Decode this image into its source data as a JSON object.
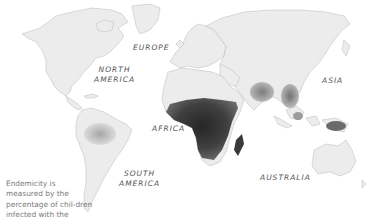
{
  "map": {
    "type": "choropleth",
    "subject": "Endemicity of parasitic infection in children",
    "shading": "darker = higher percentage of children infected",
    "colors": {
      "background": "#ffffff",
      "land": "#ececec",
      "borders": "#b9b9b9",
      "low": "#c8c8c8",
      "medium": "#8a8a8a",
      "high": "#3f3f3f",
      "very_high": "#262626",
      "label_text": "#555555",
      "caption_text": "#7a7a7a"
    },
    "regions_shaded": [
      {
        "name": "Sub-Saharan Africa",
        "level": "very high"
      },
      {
        "name": "Madagascar",
        "level": "high"
      },
      {
        "name": "South & Southeast Asia",
        "level": "medium-high"
      },
      {
        "name": "New Guinea",
        "level": "high"
      },
      {
        "name": "Amazon basin",
        "level": "low-medium"
      },
      {
        "name": "Central America",
        "level": "low"
      }
    ]
  },
  "labels": {
    "europe": "EUROPE",
    "north_america_1": "NORTH",
    "north_america_2": "AMERICA",
    "asia": "ASIA",
    "africa": "AFRICA",
    "south_america_1": "SOUTH",
    "south_america_2": "AMERICA",
    "australia": "AUSTRALIA"
  },
  "caption": "Endemicity is measured by the percentage of chil-dren infected with the parasite."
}
